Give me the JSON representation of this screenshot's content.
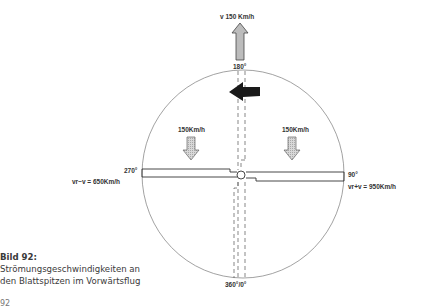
{
  "diagram": {
    "top_arrow_label": "v 150 Km/h",
    "angle_top": "180°",
    "angle_bottom": "360°/0°",
    "angle_left": "270°",
    "angle_right": "90°",
    "left_inflow_label": "150Km/h",
    "right_inflow_label": "150Km/h",
    "retreating_speed_label": "vr−v = 650Km/h",
    "advancing_speed_label": "vr+v = 950Km/h",
    "colors": {
      "circle": "#8a8a8a",
      "blade": "#333333",
      "arrow_fill": "#bcbcbc",
      "rotation_arrow": "#1a1a1a"
    }
  },
  "caption": {
    "title": "Bild 92:",
    "line1": "Strömungsgeschwindigkeiten an",
    "line2": "den Blattspitzen im Vorwärtsflug"
  },
  "page": {
    "number": "92"
  }
}
